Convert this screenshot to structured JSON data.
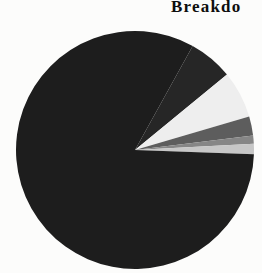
{
  "chart_data": {
    "type": "pie",
    "title": "Breakdo",
    "title_truncated": true,
    "legend": "none",
    "background": "#fcfcfb",
    "center": {
      "x": 135,
      "y": 150
    },
    "radius": 119,
    "start_angle_deg": 61,
    "direction": "clockwise",
    "values_are_estimates": true,
    "slices": [
      {
        "name": "dark-2",
        "value_pct": 6.0,
        "color": "#262626"
      },
      {
        "name": "near-white",
        "value_pct": 6.4,
        "color": "#eeeeee"
      },
      {
        "name": "dark-gray",
        "value_pct": 2.6,
        "color": "#5d5d5d"
      },
      {
        "name": "medium-gray",
        "value_pct": 1.1,
        "color": "#868686"
      },
      {
        "name": "light-gray",
        "value_pct": 1.4,
        "color": "#c7c7c7"
      },
      {
        "name": "main-black",
        "value_pct": 82.5,
        "color": "#1d1d1d"
      }
    ]
  }
}
